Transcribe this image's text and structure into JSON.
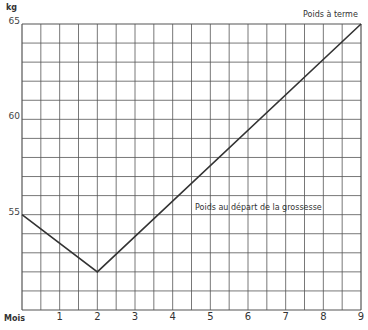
{
  "chart_data": {
    "type": "line",
    "title": "",
    "xlabel": "Mois",
    "ylabel": "kg",
    "x": [
      0,
      2,
      9
    ],
    "series": [
      {
        "name": "Poids",
        "values": [
          55,
          52,
          65
        ]
      }
    ],
    "xticks": [
      "1",
      "2",
      "3",
      "4",
      "5",
      "6",
      "7",
      "8",
      "9"
    ],
    "yticks": [
      "55",
      "60",
      "65"
    ],
    "xlim": [
      0,
      9
    ],
    "ylim": [
      50,
      65
    ],
    "grid": true,
    "grid_minor_x": 0.5,
    "grid_minor_y": 1,
    "annotations": [
      {
        "text": "Poids à terme",
        "x": 9,
        "y": 65
      },
      {
        "text": "Poids au départ de la grossesse",
        "x": 4.5,
        "y": 55
      }
    ],
    "line_color": "#333333",
    "grid_color": "#555555"
  },
  "labels": {
    "y_unit": "kg",
    "x_unit": "Mois",
    "annotation_top": "Poids à terme",
    "annotation_mid": "Poids au départ de la grossesse"
  }
}
